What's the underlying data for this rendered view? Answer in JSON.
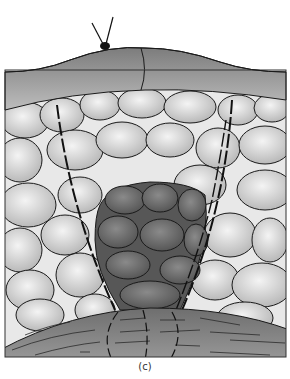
{
  "figure": {
    "caption": "(c)",
    "colors": {
      "background": "#ffffff",
      "outline": "#1a1a1a",
      "epidermis": "#9a9a9a",
      "light_cell": "#c8c8c8",
      "light_cell_highlight": "#f0f0f0",
      "dark_cell": "#5a5a5a",
      "dark_cell_highlight": "#8a8a8a",
      "base_layer": "#7e7e7e",
      "intercellular": "#e6e6e6"
    },
    "elements": {
      "insect": "insect-with-antennae",
      "epidermis": "top-curved-epidermal-layer",
      "light_cells": "pale-oval-parenchyma-cells",
      "dark_cells": "dark-cell-cluster",
      "boundary_lines": "dashed-boundary-lines",
      "base_layer": "striated-base-tissue"
    }
  }
}
